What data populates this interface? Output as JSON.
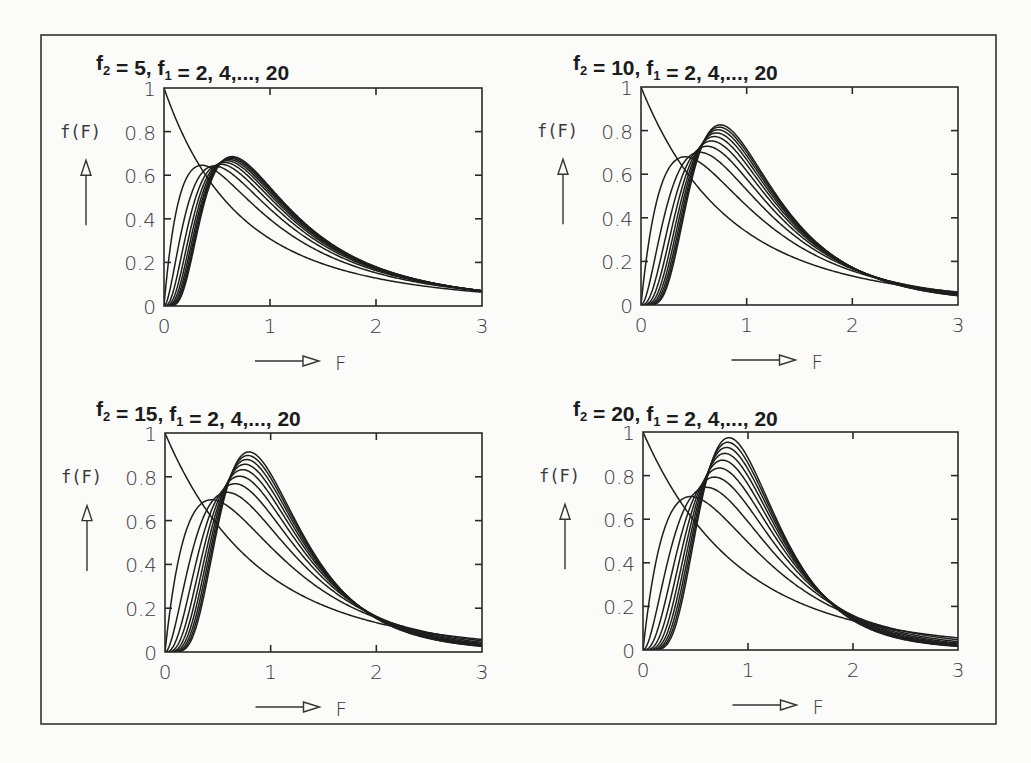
{
  "figure": {
    "frame": {
      "x": 41,
      "y": 35,
      "w": 955,
      "h": 689
    },
    "ylabel": "f(F)",
    "xlabel": "F"
  },
  "chart_data": [
    {
      "type": "line",
      "title": "f2 = 5, f1 = 2, 4,..., 20",
      "title_parts": {
        "f2_label": "f",
        "f2_sub": "2",
        "f2_value": "=    5,",
        "f1_label": "f",
        "f1_sub": "1",
        "f1_values": "=    2,    4,...,  20"
      },
      "xlabel": "F",
      "ylabel": "f(F)",
      "xlim": [
        0,
        3
      ],
      "ylim": [
        0,
        1
      ],
      "xticks": [
        "0",
        "1",
        "2",
        "3"
      ],
      "yticks": [
        "0",
        "0.2",
        "0.4",
        "0.6",
        "0.8",
        "1"
      ],
      "f2": 5,
      "series": [
        {
          "name": "f1=2",
          "f1": 2,
          "peak_F": 0.0,
          "peak_f": 1.0
        },
        {
          "name": "f1=4",
          "f1": 4,
          "peak_F": 0.36,
          "peak_f": 0.64
        },
        {
          "name": "f1=6",
          "f1": 6,
          "peak_F": 0.48,
          "peak_f": 0.63
        },
        {
          "name": "f1=8",
          "f1": 8,
          "peak_F": 0.54,
          "peak_f": 0.64
        },
        {
          "name": "f1=10",
          "f1": 10,
          "peak_F": 0.57,
          "peak_f": 0.65
        },
        {
          "name": "f1=12",
          "f1": 12,
          "peak_F": 0.6,
          "peak_f": 0.66
        },
        {
          "name": "f1=14",
          "f1": 14,
          "peak_F": 0.61,
          "peak_f": 0.66
        },
        {
          "name": "f1=16",
          "f1": 16,
          "peak_F": 0.62,
          "peak_f": 0.67
        },
        {
          "name": "f1=18",
          "f1": 18,
          "peak_F": 0.63,
          "peak_f": 0.67
        },
        {
          "name": "f1=20",
          "f1": 20,
          "peak_F": 0.64,
          "peak_f": 0.68
        }
      ],
      "box": {
        "x0": 164,
        "x1": 482,
        "y0": 88,
        "y1": 306
      },
      "title_pos": {
        "x": 96,
        "y": 70
      }
    },
    {
      "type": "line",
      "title": "f2 = 10, f1 = 2, 4,..., 20",
      "title_parts": {
        "f2_label": "f",
        "f2_sub": "2",
        "f2_value": "=  10,",
        "f1_label": "f",
        "f1_sub": "1",
        "f1_values": "=    2,    4,...,  20"
      },
      "xlabel": "F",
      "ylabel": "f(F)",
      "xlim": [
        0,
        3
      ],
      "ylim": [
        0,
        1
      ],
      "xticks": [
        "0",
        "1",
        "2",
        "3"
      ],
      "yticks": [
        "0",
        "0.2",
        "0.4",
        "0.6",
        "0.8",
        "1"
      ],
      "f2": 10,
      "series": [
        {
          "name": "f1=2",
          "f1": 2,
          "peak_F": 0.0,
          "peak_f": 1.0
        },
        {
          "name": "f1=4",
          "f1": 4,
          "peak_F": 0.42,
          "peak_f": 0.68
        },
        {
          "name": "f1=6",
          "f1": 6,
          "peak_F": 0.56,
          "peak_f": 0.69
        },
        {
          "name": "f1=8",
          "f1": 8,
          "peak_F": 0.62,
          "peak_f": 0.72
        },
        {
          "name": "f1=10",
          "f1": 10,
          "peak_F": 0.67,
          "peak_f": 0.74
        },
        {
          "name": "f1=12",
          "f1": 12,
          "peak_F": 0.69,
          "peak_f": 0.76
        },
        {
          "name": "f1=14",
          "f1": 14,
          "peak_F": 0.71,
          "peak_f": 0.78
        },
        {
          "name": "f1=16",
          "f1": 16,
          "peak_F": 0.73,
          "peak_f": 0.79
        },
        {
          "name": "f1=18",
          "f1": 18,
          "peak_F": 0.74,
          "peak_f": 0.8
        },
        {
          "name": "f1=20",
          "f1": 20,
          "peak_F": 0.75,
          "peak_f": 0.81
        }
      ],
      "box": {
        "x0": 641,
        "x1": 958,
        "y0": 87,
        "y1": 305
      },
      "title_pos": {
        "x": 573,
        "y": 70
      }
    },
    {
      "type": "line",
      "title": "f2 = 15, f1 = 2, 4,..., 20",
      "title_parts": {
        "f2_label": "f",
        "f2_sub": "2",
        "f2_value": "=  15,",
        "f1_label": "f",
        "f1_sub": "1",
        "f1_values": "=    2,    4,...,  20"
      },
      "xlabel": "F",
      "ylabel": "f(F)",
      "xlim": [
        0,
        3
      ],
      "ylim": [
        0,
        1
      ],
      "xticks": [
        "0",
        "1",
        "2",
        "3"
      ],
      "yticks": [
        "0",
        "0.2",
        "0.4",
        "0.6",
        "0.8",
        "1"
      ],
      "f2": 15,
      "series": [
        {
          "name": "f1=2",
          "f1": 2,
          "peak_F": 0.0,
          "peak_f": 1.0
        },
        {
          "name": "f1=4",
          "f1": 4,
          "peak_F": 0.44,
          "peak_f": 0.69
        },
        {
          "name": "f1=6",
          "f1": 6,
          "peak_F": 0.58,
          "peak_f": 0.72
        },
        {
          "name": "f1=8",
          "f1": 8,
          "peak_F": 0.65,
          "peak_f": 0.76
        },
        {
          "name": "f1=10",
          "f1": 10,
          "peak_F": 0.69,
          "peak_f": 0.79
        },
        {
          "name": "f1=12",
          "f1": 12,
          "peak_F": 0.72,
          "peak_f": 0.82
        },
        {
          "name": "f1=14",
          "f1": 14,
          "peak_F": 0.74,
          "peak_f": 0.84
        },
        {
          "name": "f1=16",
          "f1": 16,
          "peak_F": 0.76,
          "peak_f": 0.86
        },
        {
          "name": "f1=18",
          "f1": 18,
          "peak_F": 0.77,
          "peak_f": 0.88
        },
        {
          "name": "f1=20",
          "f1": 20,
          "peak_F": 0.78,
          "peak_f": 0.9
        }
      ],
      "box": {
        "x0": 165,
        "x1": 482,
        "y0": 433,
        "y1": 652
      },
      "title_pos": {
        "x": 96,
        "y": 416
      }
    },
    {
      "type": "line",
      "title": "f2 = 20, f1 = 2, 4,..., 20",
      "title_parts": {
        "f2_label": "f",
        "f2_sub": "2",
        "f2_value": "=  20,",
        "f1_label": "f",
        "f1_sub": "1",
        "f1_values": "=    2,    4,...,  20"
      },
      "xlabel": "F",
      "ylabel": "f(F)",
      "xlim": [
        0,
        3
      ],
      "ylim": [
        0,
        1
      ],
      "xticks": [
        "0",
        "1",
        "2",
        "3"
      ],
      "yticks": [
        "0",
        "0.2",
        "0.4",
        "0.6",
        "0.8",
        "1"
      ],
      "f2": 20,
      "series": [
        {
          "name": "f1=2",
          "f1": 2,
          "peak_F": 0.0,
          "peak_f": 1.0
        },
        {
          "name": "f1=4",
          "f1": 4,
          "peak_F": 0.45,
          "peak_f": 0.7
        },
        {
          "name": "f1=6",
          "f1": 6,
          "peak_F": 0.6,
          "peak_f": 0.75
        },
        {
          "name": "f1=8",
          "f1": 8,
          "peak_F": 0.67,
          "peak_f": 0.79
        },
        {
          "name": "f1=10",
          "f1": 10,
          "peak_F": 0.71,
          "peak_f": 0.83
        },
        {
          "name": "f1=12",
          "f1": 12,
          "peak_F": 0.74,
          "peak_f": 0.86
        },
        {
          "name": "f1=14",
          "f1": 14,
          "peak_F": 0.76,
          "peak_f": 0.89
        },
        {
          "name": "f1=16",
          "f1": 16,
          "peak_F": 0.78,
          "peak_f": 0.92
        },
        {
          "name": "f1=18",
          "f1": 18,
          "peak_F": 0.79,
          "peak_f": 0.94
        },
        {
          "name": "f1=20",
          "f1": 20,
          "peak_F": 0.8,
          "peak_f": 0.96
        }
      ],
      "box": {
        "x0": 643,
        "x1": 958,
        "y0": 432,
        "y1": 650
      },
      "title_pos": {
        "x": 573,
        "y": 416
      }
    }
  ]
}
